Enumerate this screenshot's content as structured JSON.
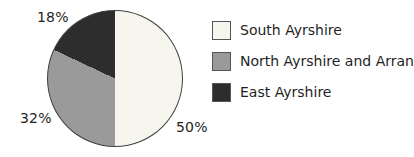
{
  "chart_data": {
    "type": "pie",
    "title": "",
    "categories": [
      "South Ayrshire",
      "North Ayrshire and Arran",
      "East Ayrshire"
    ],
    "values": [
      50,
      32,
      18
    ],
    "unit": "%",
    "value_labels": [
      "50%",
      "32%",
      "18%"
    ],
    "colors": [
      "#f6f6ee",
      "#9a9a9a",
      "#2d2d2d"
    ],
    "start_angle_deg": 0,
    "direction": "clockwise",
    "legend_position": "right",
    "outline_color": "#3f3f3f"
  },
  "legend": {
    "items": [
      {
        "label": "South Ayrshire",
        "color": "#f6f6ee"
      },
      {
        "label": "North Ayrshire and Arran",
        "color": "#9a9a9a"
      },
      {
        "label": "East Ayrshire",
        "color": "#2d2d2d"
      }
    ]
  }
}
